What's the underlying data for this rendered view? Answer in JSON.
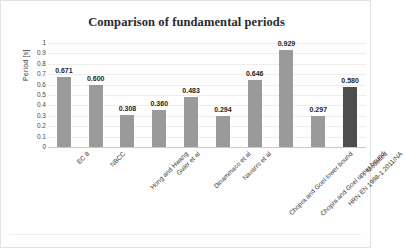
{
  "chart_data": {
    "type": "bar",
    "title": "Comparison of fundamental periods",
    "xlabel": "",
    "ylabel": "Period [s]",
    "ylim": [
      0,
      1
    ],
    "ytick_step": 0.1,
    "grid": true,
    "legend": "none",
    "categories": [
      "EC 8",
      "NBCC",
      "Hong and Hwang",
      "Guler et al",
      "Dinammaco et al",
      "Navarro et al",
      "Chopra and Goel lower bound",
      "Chopra and Goel upper bound",
      "HRN EN 1998-1:2011/NA",
      "Modelled"
    ],
    "values": [
      0.671,
      0.6,
      0.308,
      0.36,
      0.483,
      0.294,
      0.646,
      0.929,
      0.297,
      0.58
    ],
    "value_labels": [
      "0.671",
      "0.600",
      "0.308",
      "0.360",
      "0.483",
      "0.294",
      "0.646",
      "0.929",
      "0.297",
      "0.580"
    ],
    "ytick_labels": [
      "1",
      "0.9",
      "0.8",
      "0.7",
      "0.6",
      "0.5",
      "0.4",
      "0.3",
      "0.2",
      "0.1",
      "0"
    ],
    "ytick_values": [
      1,
      0.9,
      0.8,
      0.7,
      0.6,
      0.5,
      0.4,
      0.3,
      0.2,
      0.1,
      0
    ],
    "bar_color": "#9a9a9a",
    "highlight_bar_color": "#4d4d4d",
    "highlight_index": 9,
    "gridline_color": "#ededed",
    "title_color": "#2a2a2a",
    "axis_text_color": "#4a4a4a"
  }
}
